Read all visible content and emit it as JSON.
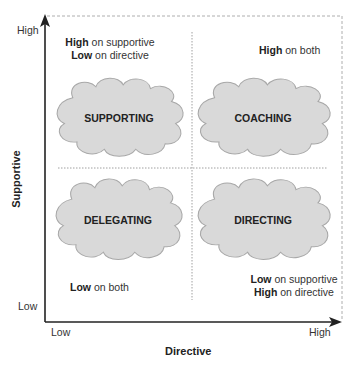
{
  "diagram": {
    "type": "quadrant-matrix",
    "x_axis": {
      "title": "Directive",
      "low_label": "Low",
      "high_label": "High"
    },
    "y_axis": {
      "title": "Supportive",
      "low_label": "Low",
      "high_label": "High"
    },
    "quadrants": {
      "top_left": {
        "name": "SUPPORTING",
        "desc_line1_bold": "High",
        "desc_line1_rest": " on supportive",
        "desc_line2_bold": "Low",
        "desc_line2_rest": " on directive"
      },
      "top_right": {
        "name": "COACHING",
        "desc_line1_bold": "High",
        "desc_line1_rest": " on both"
      },
      "bottom_left": {
        "name": "DELEGATING",
        "desc_line1_bold": "Low",
        "desc_line1_rest": " on both"
      },
      "bottom_right": {
        "name": "DIRECTING",
        "desc_line1_bold": "Low",
        "desc_line1_rest": " on supportive",
        "desc_line2_bold": "High",
        "desc_line2_rest": " on directive"
      }
    },
    "colors": {
      "cloud_fill": "#d9d9d9",
      "cloud_stroke": "#a8a8a8",
      "axis": "#222222",
      "divider": "#888888",
      "border_dashed": "#999999"
    }
  }
}
